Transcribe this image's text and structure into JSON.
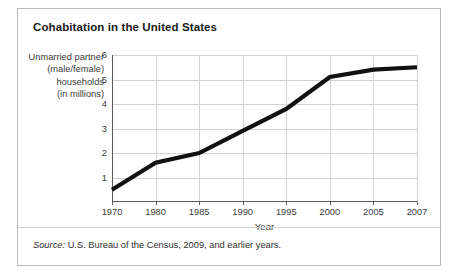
{
  "card": {
    "title": "Cohabitation in the United States",
    "source_prefix": "Source:",
    "source_text": " U.S. Bureau of the Census, 2009, and earlier years."
  },
  "chart_data": {
    "type": "line",
    "title": "Cohabitation in the United States",
    "xlabel": "Year",
    "ylabel": "Unmarried partner (male/female) households (in millions)",
    "ylabel_lines": [
      "Unmarried partner",
      "(male/female)",
      "households",
      "(in millions)"
    ],
    "categories": [
      "1970",
      "1980",
      "1985",
      "1990",
      "1995",
      "2000",
      "2005",
      "2007"
    ],
    "values": [
      0.5,
      1.6,
      2.0,
      2.9,
      3.8,
      5.1,
      5.4,
      5.5
    ],
    "ylim": [
      0,
      6
    ],
    "yticks": [
      "1",
      "2",
      "3",
      "4",
      "5",
      "6"
    ],
    "ytick_values": [
      1,
      2,
      3,
      4,
      5,
      6
    ],
    "grid": true,
    "legend": "none",
    "line_color": "#111111",
    "grid_color": "#d3d3d3",
    "axis_color": "#5a5a5a"
  }
}
